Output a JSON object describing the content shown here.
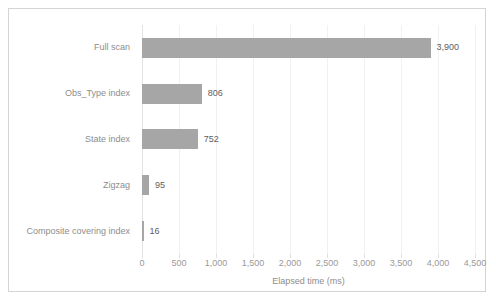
{
  "chart_data": {
    "type": "bar",
    "orientation": "horizontal",
    "title": "",
    "subtitle": "",
    "xlabel": "Elapsed time (ms)",
    "ylabel": "",
    "categories": [
      "Full scan",
      "Obs_Type index",
      "State index",
      "Zigzag",
      "Composite covering index"
    ],
    "values": [
      3900,
      806,
      752,
      95,
      16
    ],
    "data_labels": [
      "3,900",
      "806",
      "752",
      "95",
      "16"
    ],
    "xlim": [
      0,
      4500
    ],
    "xticks": [
      0,
      500,
      1000,
      1500,
      2000,
      2500,
      3000,
      3500,
      4000,
      4500
    ],
    "xtick_labels": [
      "0",
      "500",
      "1,000",
      "1,500",
      "2,000",
      "2,500",
      "3,000",
      "3,500",
      "4,000",
      "4,500"
    ],
    "grid": true,
    "grid_axis": "x",
    "legend": false,
    "legend_position": "none",
    "series": [
      {
        "name": "Elapsed time (ms)",
        "values": [
          3900,
          806,
          752,
          95,
          16
        ]
      }
    ],
    "colors": {
      "bar": "#a6a6a6",
      "gridline": "#f1f1f1",
      "axis_line": "#e3e3e3",
      "frame_border": "#d4d4d4",
      "category_label_text": "#8d8d8d",
      "tick_label_text": "#9a9a9a",
      "data_label_text": "#606060",
      "plot_background": "#ffffff"
    }
  }
}
